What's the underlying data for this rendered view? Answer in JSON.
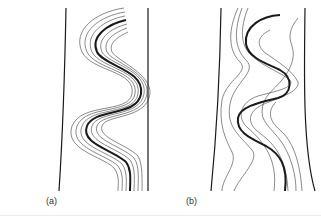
{
  "figure": {
    "panels": [
      {
        "label": "(a)",
        "description": "Regular parallel S-shaped lines between two boundaries; thick center line with offset thin lines"
      },
      {
        "label": "(b)",
        "description": "Irregular, diverging S-shaped lines between two boundaries; thick center line with distorted thin lines"
      }
    ],
    "colors": {
      "line": "#1a1a1a",
      "thin_line": "#3a3a3a",
      "background": "#ffffff"
    }
  }
}
